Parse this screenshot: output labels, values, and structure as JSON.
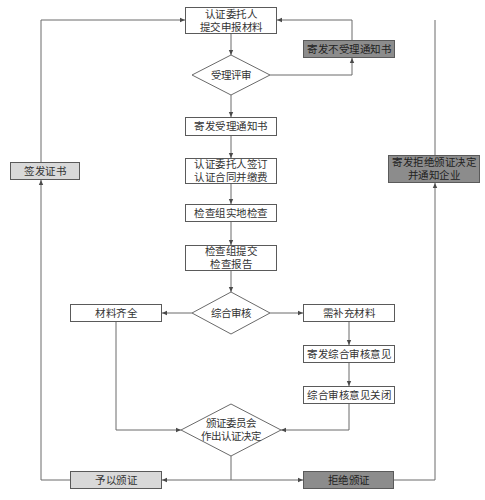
{
  "colors": {
    "line": "#6a6a6a",
    "box_white": "#ffffff",
    "box_light_grey": "#d9d9d9",
    "box_dark_grey": "#8c8c8c"
  },
  "nodes": {
    "submit": {
      "lines": [
        "认证委托人",
        "提交申报材料"
      ],
      "shape": "rect",
      "fill": "white"
    },
    "reject_notice": {
      "lines": [
        "寄发不受理通知书"
      ],
      "shape": "rect",
      "fill": "dark"
    },
    "acceptance_review": {
      "lines": [
        "受理评审"
      ],
      "shape": "diamond"
    },
    "accept_notice": {
      "lines": [
        "寄发受理通知书"
      ],
      "shape": "rect",
      "fill": "white"
    },
    "sign_contract": {
      "lines": [
        "认证委托人签订",
        "认证合同并缴费"
      ],
      "shape": "rect",
      "fill": "white"
    },
    "onsite_inspection": {
      "lines": [
        "检查组实地检查"
      ],
      "shape": "rect",
      "fill": "white"
    },
    "submit_report": {
      "lines": [
        "检查组提交",
        "检查报告"
      ],
      "shape": "rect",
      "fill": "white"
    },
    "comprehensive_review": {
      "lines": [
        "综合审核"
      ],
      "shape": "diamond"
    },
    "materials_complete": {
      "lines": [
        "材料齐全"
      ],
      "shape": "rect",
      "fill": "white"
    },
    "need_materials": {
      "lines": [
        "需补充材料"
      ],
      "shape": "rect",
      "fill": "white"
    },
    "send_opinion": {
      "lines": [
        "寄发综合审核意见"
      ],
      "shape": "rect",
      "fill": "white"
    },
    "close_opinion": {
      "lines": [
        "综合审核意见关闭"
      ],
      "shape": "rect",
      "fill": "white"
    },
    "committee_decision": {
      "lines": [
        "颁证委员会",
        "作出认证决定"
      ],
      "shape": "diamond"
    },
    "grant": {
      "lines": [
        "予以颁证"
      ],
      "shape": "rect",
      "fill": "light"
    },
    "deny": {
      "lines": [
        "拒绝颁证"
      ],
      "shape": "rect",
      "fill": "dark"
    },
    "issue_cert": {
      "lines": [
        "签发证书"
      ],
      "shape": "rect",
      "fill": "light"
    },
    "deny_notice": {
      "lines": [
        "寄发拒绝颁证决定",
        "并通知企业"
      ],
      "shape": "rect",
      "fill": "dark"
    }
  },
  "edges": [
    [
      "submit",
      "acceptance_review"
    ],
    [
      "acceptance_review",
      "reject_notice"
    ],
    [
      "reject_notice",
      "submit"
    ],
    [
      "acceptance_review",
      "accept_notice"
    ],
    [
      "accept_notice",
      "sign_contract"
    ],
    [
      "sign_contract",
      "onsite_inspection"
    ],
    [
      "onsite_inspection",
      "submit_report"
    ],
    [
      "submit_report",
      "comprehensive_review"
    ],
    [
      "comprehensive_review",
      "materials_complete"
    ],
    [
      "comprehensive_review",
      "need_materials"
    ],
    [
      "need_materials",
      "send_opinion"
    ],
    [
      "send_opinion",
      "close_opinion"
    ],
    [
      "materials_complete",
      "committee_decision"
    ],
    [
      "close_opinion",
      "committee_decision"
    ],
    [
      "committee_decision",
      "grant"
    ],
    [
      "committee_decision",
      "deny"
    ],
    [
      "grant",
      "issue_cert"
    ],
    [
      "issue_cert",
      "submit"
    ],
    [
      "deny",
      "deny_notice"
    ],
    [
      "deny_notice",
      "submit"
    ]
  ]
}
